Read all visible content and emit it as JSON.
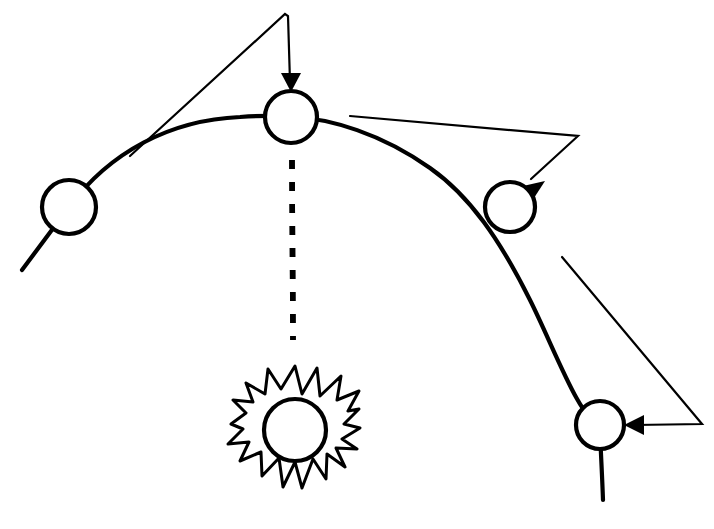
{
  "canvas": {
    "width": 714,
    "height": 529,
    "background_color": "#ffffff",
    "ink_color": "#000000"
  },
  "figure": {
    "kind": "line-drawing-diagram"
  },
  "strokes": {
    "trajectory_width": 4.2,
    "node_outline_width": 4.2,
    "pointer_width": 2.2,
    "dash_width": 5.5,
    "dash_pattern": "9 13",
    "burst_width": 3.0
  },
  "nodes": [
    {
      "id": "node-1",
      "label": "node-upper-left",
      "cx": 69,
      "cy": 207,
      "r": 27
    },
    {
      "id": "node-2",
      "label": "node-apex",
      "cx": 291,
      "cy": 117,
      "r": 26
    },
    {
      "id": "node-3",
      "label": "node-right",
      "cx": 510,
      "cy": 207,
      "r": 25
    },
    {
      "id": "node-4",
      "label": "node-lower-right",
      "cx": 600,
      "cy": 425,
      "r": 24
    }
  ],
  "burst": {
    "id": "burst-node",
    "label": "starburst-node",
    "cx": 295,
    "cy": 430,
    "inner_r": 31,
    "spike_min_r": 40,
    "spike_max_r": 64,
    "points": 15
  },
  "trajectory": {
    "id": "trajectory-arc",
    "label": "arc-path",
    "d": "M 22 270 L 69 207 C 110 152 170 120 240 117 C 270 115 285 116 291 117 C 330 118 382 134 430 168 C 470 196 500 240 530 300 C 555 350 580 420 600 425 C 600 440 602 470 603 500"
  },
  "dashed_links": [
    {
      "id": "dash-1",
      "label": "dashed-link-node1-to-burst",
      "from": {
        "x": 95,
        "y": 233
      },
      "to": {
        "x": 242,
        "y": 377
      }
    },
    {
      "id": "dash-2",
      "label": "dashed-link-node2-to-burst",
      "from": {
        "x": 292,
        "y": 160
      },
      "to": {
        "x": 293,
        "y": 340
      }
    }
  ],
  "pointers": [
    {
      "id": "pointer-1",
      "label": "callout-arrow-to-apex-node",
      "d": "M 130 156 L 285 14 L 288 16 L 290 82",
      "head": {
        "x": 291,
        "y": 90,
        "angle": 90,
        "size": 13
      }
    },
    {
      "id": "pointer-2",
      "label": "callout-arrow-to-right-node",
      "d": "M 350 116 L 578 136 L 531 179",
      "head": {
        "x": 524,
        "y": 185,
        "angle": 138,
        "size": 13
      }
    },
    {
      "id": "pointer-3",
      "label": "callout-arrow-to-lower-right-node",
      "d": "M 562 257 L 702 424 L 634 425",
      "head": {
        "x": 626,
        "y": 425,
        "angle": 180,
        "size": 13
      }
    }
  ]
}
